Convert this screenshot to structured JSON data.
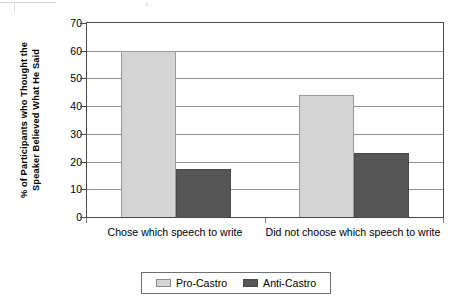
{
  "chart_data": {
    "type": "bar",
    "title": "",
    "xlabel": "",
    "ylabel": "% of Participants who Thought the Speaker Believed What He Said",
    "ylabel_lines": [
      "% of Participants who Thought the",
      "Speaker Believed What He Said"
    ],
    "categories": [
      "Chose which speech to write",
      "Did not choose which speech to write"
    ],
    "series": [
      {
        "name": "Pro-Castro",
        "values": [
          60,
          44
        ],
        "color": "#d4d4d4"
      },
      {
        "name": "Anti-Castro",
        "values": [
          17.5,
          23
        ],
        "color": "#565656"
      }
    ],
    "ylim": [
      0,
      70
    ],
    "yticks": [
      0,
      10,
      20,
      30,
      40,
      50,
      60,
      70
    ],
    "ytick_labels": [
      "0",
      "10",
      "20",
      "30",
      "40",
      "50",
      "60",
      "70"
    ],
    "grid": "horizontal",
    "legend_position": "bottom"
  },
  "legend": {
    "items": [
      {
        "label": "Pro-Castro",
        "swatch": "light-gray-swatch"
      },
      {
        "label": "Anti-Castro",
        "swatch": "dark-gray-swatch"
      }
    ]
  },
  "colors": {
    "pro_castro": "#d4d4d4",
    "anti_castro": "#565656",
    "axis": "#4a4a4a",
    "gridline": "#8f8f8f",
    "background": "#ffffff"
  }
}
